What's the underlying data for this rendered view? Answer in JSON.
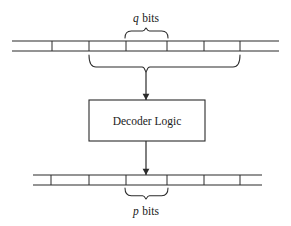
{
  "figure": {
    "kind": "block-diagram",
    "title_visible": false,
    "background_color": "#ffffff",
    "line_color": "#2b2b2b",
    "text_color": "#1a1a1a"
  },
  "labels": {
    "top_brace_label_var": "q",
    "top_brace_label_unit": "bits",
    "top_brace_label_full": "q bits",
    "bottom_brace_label_var": "p",
    "bottom_brace_label_unit": "bits",
    "bottom_brace_label_full": "p bits"
  },
  "block": {
    "name": "decoder-logic",
    "label": "Decoder Logic",
    "x": 89,
    "y": 100,
    "width": 116,
    "height": 41
  },
  "top_bus": {
    "name": "input-bus",
    "left": 12,
    "right": 279,
    "top_rail_y": 41,
    "bottom_rail_y": 51,
    "tick_positions": [
      52,
      89,
      126,
      167,
      204,
      240
    ]
  },
  "bottom_bus": {
    "name": "output-bus",
    "left": 33,
    "right": 262,
    "top_rail_y": 175,
    "bottom_rail_y": 185,
    "tick_positions": [
      51,
      89,
      126,
      167,
      204,
      240
    ]
  },
  "braces": {
    "top_small": {
      "name": "q-bits-brace",
      "left": 125,
      "right": 168,
      "center": 146,
      "baseline_y": 38,
      "tip_y": 28,
      "orientation": "opens-down"
    },
    "top_large": {
      "name": "input-group-brace",
      "left": 89,
      "right": 240,
      "center": 146,
      "baseline_y": 55,
      "tip_y": 72,
      "orientation": "opens-up"
    },
    "bottom_small": {
      "name": "p-bits-brace",
      "left": 125,
      "right": 168,
      "center": 146,
      "baseline_y": 188,
      "tip_y": 199,
      "orientation": "opens-up"
    }
  },
  "arrows": [
    {
      "name": "bus-to-decoder-arrow",
      "x": 146,
      "from_y": 72,
      "to_y": 100,
      "direction": "down"
    },
    {
      "name": "decoder-to-bus-arrow",
      "x": 146,
      "from_y": 141,
      "to_y": 175,
      "direction": "down"
    }
  ]
}
